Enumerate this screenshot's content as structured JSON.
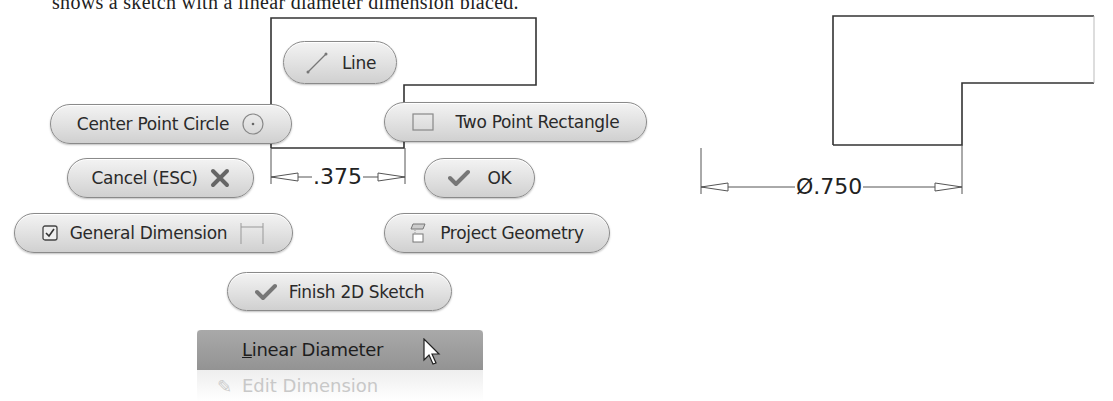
{
  "caption": "shows a sketch with a linear diameter dimension placed.",
  "marking_menu": {
    "line": {
      "label": "Line",
      "icon": "line-icon"
    },
    "center_point_circle": {
      "label": "Center Point Circle",
      "icon": "circle-icon"
    },
    "two_point_rectangle": {
      "label": "Two Point Rectangle",
      "icon": "rectangle-icon"
    },
    "cancel": {
      "label": "Cancel (ESC)",
      "icon": "x-icon"
    },
    "ok": {
      "label": "OK",
      "icon": "checkmark-icon"
    },
    "general_dimension": {
      "label": "General Dimension",
      "icon": "dimension-icon",
      "checkbox": "checked"
    },
    "project_geometry": {
      "label": "Project Geometry",
      "icon": "project-geometry-icon"
    },
    "finish_sketch": {
      "label": "Finish 2D Sketch",
      "icon": "checkmark-icon"
    }
  },
  "context_menu": {
    "items": [
      {
        "label_accel": "L",
        "label_rest": "inear Diameter",
        "state": "highlighted"
      },
      {
        "label": "Edit Dimension",
        "state": "faded"
      }
    ]
  },
  "left_sketch": {
    "dimension": ".375"
  },
  "right_sketch": {
    "dimension": "Ø.750"
  },
  "colors": {
    "pill_border": "#8a8a8a",
    "pill_fill_top": "#f3f3f3",
    "pill_fill_bottom": "#d0d0d0",
    "menu_highlight": "#a0a0a0",
    "sketch_line": "#333333",
    "dimension_line": "#555555"
  }
}
